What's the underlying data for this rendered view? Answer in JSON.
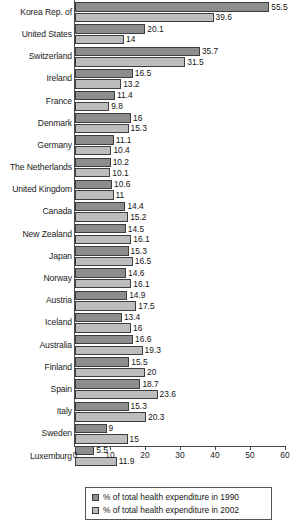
{
  "chart_data": {
    "type": "bar",
    "orientation": "horizontal",
    "title": "",
    "xlabel": "",
    "ylabel": "",
    "xlim": [
      0,
      60
    ],
    "xticks": [
      0,
      10,
      20,
      30,
      40,
      50,
      60
    ],
    "grid": false,
    "legend_position": "bottom",
    "categories": [
      "Korea Rep. of",
      "United States",
      "Switzerland",
      "Ireland",
      "France",
      "Denmark",
      "Germany",
      "The Netherlands",
      "United Kingdom",
      "Canada",
      "New Zealand",
      "Japan",
      "Norway",
      "Austria",
      "Iceland",
      "Australia",
      "Finland",
      "Spain",
      "Italy",
      "Sweden",
      "Luxemburg"
    ],
    "series": [
      {
        "name": "% of total health expenditure in 1990",
        "color": "#8d8d8d",
        "values": [
          55.5,
          20.1,
          35.7,
          16.5,
          11.4,
          16,
          11.1,
          10.2,
          10.6,
          14.4,
          14.5,
          15.3,
          14.6,
          14.9,
          13.4,
          16.6,
          15.5,
          18.7,
          15.3,
          9,
          5.5
        ],
        "labels": [
          "55.5",
          "20.1",
          "35.7",
          "16.5",
          "11.4",
          "16",
          "11.1",
          "10.2",
          "10.6",
          "14.4",
          "14.5",
          "15.3",
          "14.6",
          "14.9",
          "13.4",
          "16.6",
          "15.5",
          "18.7",
          "15.3",
          "9",
          "5.5"
        ]
      },
      {
        "name": "% of total health expenditure in 2002",
        "color": "#bdbdbd",
        "values": [
          39.6,
          14,
          31.5,
          13.2,
          9.8,
          15.3,
          10.4,
          10.1,
          11,
          15.2,
          16.1,
          16.5,
          16.1,
          17.5,
          16,
          19.3,
          20,
          23.6,
          20.3,
          15,
          11.9
        ],
        "labels": [
          "39.6",
          "14",
          "31.5",
          "13.2",
          "9.8",
          "15.3",
          "10.4",
          "10.1",
          "11",
          "15.2",
          "16.1",
          "16.5",
          "16.1",
          "17.5",
          "16",
          "19.3",
          "20",
          "23.6",
          "20.3",
          "15",
          "11.9"
        ]
      }
    ],
    "legend": [
      "% of total health expenditure in 1990",
      "% of total health expenditure in 2002"
    ]
  }
}
